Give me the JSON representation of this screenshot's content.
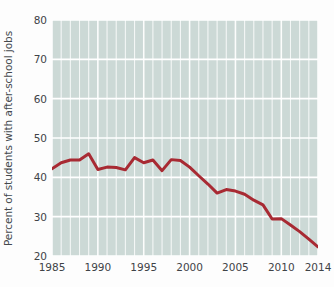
{
  "chart_data": {
    "type": "line",
    "title": "",
    "xlabel": "",
    "ylabel": "Percent of students with after-school jobs",
    "xlim": [
      1985,
      2014
    ],
    "ylim": [
      20,
      80
    ],
    "xticks": [
      1985,
      1990,
      1995,
      2000,
      2005,
      2010,
      2014
    ],
    "yticks": [
      20,
      30,
      40,
      50,
      60,
      70,
      80
    ],
    "grid": "both",
    "grid_color": "#ffffff",
    "minor_x_grid_every_year": true,
    "plot_background": "#ccd9d6",
    "line_color": "#a82a33",
    "line_width": 3,
    "legend": "none",
    "x": [
      1985,
      1986,
      1987,
      1988,
      1989,
      1990,
      1991,
      1992,
      1993,
      1994,
      1995,
      1996,
      1997,
      1998,
      1999,
      2000,
      2001,
      2002,
      2003,
      2004,
      2005,
      2006,
      2007,
      2008,
      2009,
      2010,
      2011,
      2012,
      2013,
      2014
    ],
    "values": [
      42.2,
      43.7,
      44.4,
      44.4,
      46.0,
      42.0,
      42.6,
      42.5,
      41.9,
      45.0,
      43.7,
      44.4,
      41.7,
      44.5,
      44.3,
      42.6,
      40.4,
      38.3,
      36.0,
      36.9,
      36.5,
      35.7,
      34.2,
      33.0,
      29.4,
      29.5,
      27.9,
      26.2,
      24.3,
      22.3
    ],
    "series": [
      {
        "name": "Percent of students with after-school jobs",
        "color": "#a82a33",
        "values": [
          42.2,
          43.7,
          44.4,
          44.4,
          46.0,
          42.0,
          42.6,
          42.5,
          41.9,
          45.0,
          43.7,
          44.4,
          41.7,
          44.5,
          44.3,
          42.6,
          40.4,
          38.3,
          36.0,
          36.9,
          36.5,
          35.7,
          34.2,
          33.0,
          29.4,
          29.5,
          27.9,
          26.2,
          24.3,
          22.3
        ]
      }
    ],
    "ytick_labels": [
      "20",
      "30",
      "40",
      "50",
      "60",
      "70",
      "80"
    ],
    "xtick_labels": [
      "1985",
      "1990",
      "1995",
      "2000",
      "2005",
      "2010",
      "2014"
    ]
  }
}
